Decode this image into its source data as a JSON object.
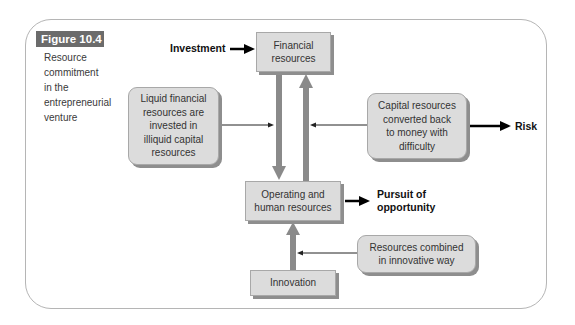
{
  "figure": {
    "label": "Figure 10.4",
    "caption_lines": [
      "Resource",
      "commitment",
      "in the",
      "entrepreneurial",
      "venture"
    ]
  },
  "nodes": {
    "financial": "Financial resources",
    "financial_lines": [
      "Financial",
      "resources"
    ],
    "liquid_lines": [
      "Liquid financial",
      "resources are",
      "invested in",
      "illiquid capital",
      "resources"
    ],
    "capital_lines": [
      "Capital resources",
      "converted back",
      "to money with",
      "difficulty"
    ],
    "operating_lines": [
      "Operating and",
      "human resources"
    ],
    "combined_lines": [
      "Resources combined",
      "in innovative way"
    ],
    "innovation": "Innovation"
  },
  "labels": {
    "investment": "Investment",
    "risk": "Risk",
    "pursuit_lines": [
      "Pursuit of",
      "opportunity"
    ]
  },
  "colors": {
    "box_fill": "#dcdcdc",
    "box_shadow": "#8e8e8e",
    "thick_arrow": "#8a8a8a",
    "figure_label_bg": "#6b6b6b"
  }
}
